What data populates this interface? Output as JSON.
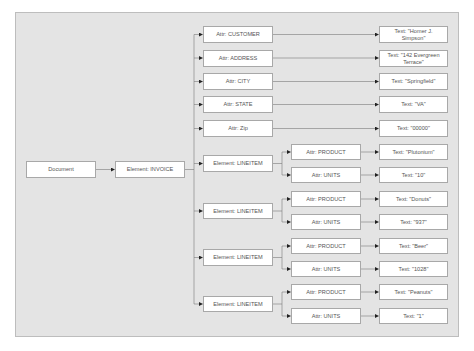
{
  "diagram": {
    "root": {
      "label": "Document"
    },
    "invoice": {
      "label": "Element: INVOICE"
    },
    "attributes": [
      {
        "label": "Attr: CUSTOMER",
        "text": "Text: \"Homer J. Simpson\""
      },
      {
        "label": "Attr: ADDRESS",
        "text": "Text: \"142 Evergreen Terrace\""
      },
      {
        "label": "Attr: CITY",
        "text": "Text: \"Springfield\""
      },
      {
        "label": "Attr: STATE",
        "text": "Text: \"VA\""
      },
      {
        "label": "Attr: Zip",
        "text": "Text: \"00000\""
      }
    ],
    "lineitems": [
      {
        "label": "Element: LINEITEM",
        "product_label": "Attr: PRODUCT",
        "product_text": "Text: \"Plutonium\"",
        "units_label": "Attr: UNITS",
        "units_text": "Text: \"10\""
      },
      {
        "label": "Element: LINEITEM",
        "product_label": "Attr: PRODUCT",
        "product_text": "Text: \"Donuts\"",
        "units_label": "Attr: UNITS",
        "units_text": "Text: \"937\""
      },
      {
        "label": "Element: LINEITEM",
        "product_label": "Attr: PRODUCT",
        "product_text": "Text: \"Beer\"",
        "units_label": "Attr: UNITS",
        "units_text": "Text: \"1028\""
      },
      {
        "label": "Element: LINEITEM",
        "product_label": "Attr: PRODUCT",
        "product_text": "Text: \"Peanuts\"",
        "units_label": "Attr: UNITS",
        "units_text": "Text: \"1\""
      }
    ],
    "colors": {
      "panel_bg": "#e4e4e4",
      "node_bg": "#ffffff",
      "node_border": "#a8a8a8",
      "wire": "#7a7a7a",
      "arrow": "#222222",
      "text": "#555555"
    }
  }
}
